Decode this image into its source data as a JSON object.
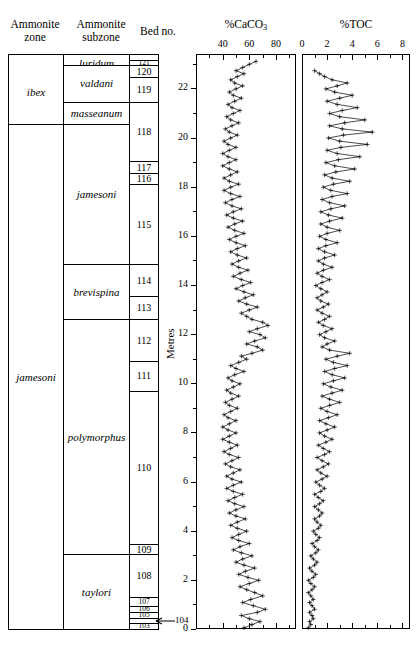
{
  "headers": {
    "zone": "Ammonite\nzone",
    "zone_l1": "Ammonite",
    "zone_l2": "zone",
    "subzone_l1": "Ammonite",
    "subzone_l2": "subzone",
    "bed": "Bed no."
  },
  "zones": [
    {
      "label": "ibex",
      "top_m": 23.15,
      "bottom_m": 20.55
    },
    {
      "label": "jamesoni",
      "top_m": 20.55,
      "bottom_m": 0.0
    }
  ],
  "subzones": [
    {
      "label": "luridum",
      "top_m": 23.15,
      "bottom_m": 22.95
    },
    {
      "label": "valdani",
      "top_m": 22.95,
      "bottom_m": 21.45
    },
    {
      "label": "masseanum",
      "top_m": 21.45,
      "bottom_m": 20.55
    },
    {
      "label": "jamesoni",
      "top_m": 20.55,
      "bottom_m": 14.85
    },
    {
      "label": "brevispina",
      "top_m": 14.85,
      "bottom_m": 12.6
    },
    {
      "label": "polymorphus",
      "top_m": 12.6,
      "bottom_m": 3.05
    },
    {
      "label": "taylori",
      "top_m": 3.05,
      "bottom_m": 0.0
    }
  ],
  "beds": [
    {
      "no": "121",
      "top_m": 23.15,
      "bottom_m": 22.95,
      "tiny": true
    },
    {
      "no": "120",
      "top_m": 22.95,
      "bottom_m": 22.45,
      "tiny": false
    },
    {
      "no": "119",
      "top_m": 22.45,
      "bottom_m": 21.45,
      "tiny": false
    },
    {
      "no": "118",
      "top_m": 21.45,
      "bottom_m": 19.05,
      "tiny": false
    },
    {
      "no": "117",
      "top_m": 19.05,
      "bottom_m": 18.55,
      "tiny": false
    },
    {
      "no": "116",
      "top_m": 18.55,
      "bottom_m": 18.1,
      "tiny": false
    },
    {
      "no": "115",
      "top_m": 18.1,
      "bottom_m": 14.85,
      "tiny": false
    },
    {
      "no": "114",
      "top_m": 14.85,
      "bottom_m": 13.55,
      "tiny": false
    },
    {
      "no": "113",
      "top_m": 13.55,
      "bottom_m": 12.6,
      "tiny": false
    },
    {
      "no": "112",
      "top_m": 12.6,
      "bottom_m": 10.9,
      "tiny": false
    },
    {
      "no": "111",
      "top_m": 10.9,
      "bottom_m": 9.7,
      "tiny": false
    },
    {
      "no": "110",
      "top_m": 9.7,
      "bottom_m": 3.45,
      "tiny": false
    },
    {
      "no": "109",
      "top_m": 3.45,
      "bottom_m": 3.05,
      "tiny": false
    },
    {
      "no": "108",
      "top_m": 3.05,
      "bottom_m": 1.3,
      "tiny": false
    },
    {
      "no": "107",
      "top_m": 1.3,
      "bottom_m": 0.95,
      "tiny": true
    },
    {
      "no": "106",
      "top_m": 0.95,
      "bottom_m": 0.7,
      "tiny": true
    },
    {
      "no": "105",
      "top_m": 0.7,
      "bottom_m": 0.45,
      "tiny": true
    },
    {
      "no": "103",
      "top_m": 0.25,
      "bottom_m": 0.0,
      "tiny": true
    }
  ],
  "bed104_callout": {
    "label": "104",
    "metres": 0.33
  },
  "metres_axis": {
    "label": "Metres",
    "min": 0,
    "max": 23.4,
    "ticks": [
      0,
      2,
      4,
      6,
      8,
      10,
      12,
      14,
      16,
      18,
      20,
      22
    ],
    "minor_step": 1
  },
  "chart_data": [
    {
      "type": "line",
      "title": "%CaCO3",
      "title_main": "%CaCO",
      "title_sub": "3",
      "xlabel": "%CaCO3",
      "ylabel": "Metres",
      "orientation": "vertical-depth",
      "xlim": [
        20,
        95
      ],
      "ticks": [
        40,
        60,
        80
      ],
      "minor_step": 10,
      "grid": false,
      "marker": "plus",
      "y": [
        0.05,
        0.18,
        0.3,
        0.42,
        0.55,
        0.68,
        0.8,
        0.95,
        1.08,
        1.2,
        1.35,
        1.48,
        1.6,
        1.72,
        1.85,
        1.98,
        2.1,
        2.22,
        2.35,
        2.48,
        2.6,
        2.72,
        2.85,
        2.98,
        3.1,
        3.22,
        3.35,
        3.48,
        3.6,
        3.72,
        3.85,
        3.98,
        4.1,
        4.22,
        4.35,
        4.48,
        4.6,
        4.72,
        4.85,
        4.98,
        5.1,
        5.22,
        5.35,
        5.48,
        5.6,
        5.72,
        5.85,
        5.98,
        6.1,
        6.22,
        6.35,
        6.48,
        6.6,
        6.72,
        6.85,
        6.98,
        7.1,
        7.22,
        7.35,
        7.48,
        7.6,
        7.72,
        7.85,
        7.98,
        8.1,
        8.22,
        8.35,
        8.48,
        8.6,
        8.72,
        8.85,
        8.98,
        9.1,
        9.22,
        9.35,
        9.48,
        9.6,
        9.72,
        9.85,
        9.98,
        10.1,
        10.22,
        10.35,
        10.48,
        10.6,
        10.72,
        10.85,
        10.98,
        11.1,
        11.22,
        11.35,
        11.48,
        11.6,
        11.72,
        11.85,
        11.98,
        12.1,
        12.22,
        12.35,
        12.48,
        12.6,
        12.72,
        12.85,
        12.98,
        13.1,
        13.22,
        13.35,
        13.48,
        13.6,
        13.72,
        13.85,
        13.98,
        14.1,
        14.22,
        14.35,
        14.48,
        14.6,
        14.72,
        14.85,
        14.98,
        15.1,
        15.22,
        15.35,
        15.48,
        15.6,
        15.72,
        15.85,
        15.98,
        16.1,
        16.22,
        16.35,
        16.48,
        16.6,
        16.72,
        16.85,
        16.98,
        17.1,
        17.22,
        17.35,
        17.48,
        17.6,
        17.72,
        17.85,
        17.98,
        18.1,
        18.22,
        18.35,
        18.48,
        18.6,
        18.72,
        18.85,
        18.98,
        19.1,
        19.22,
        19.35,
        19.48,
        19.6,
        19.72,
        19.85,
        19.98,
        20.1,
        20.22,
        20.35,
        20.48,
        20.6,
        20.72,
        20.85,
        20.98,
        21.1,
        21.22,
        21.35,
        21.48,
        21.6,
        21.72,
        21.85,
        21.98,
        22.1,
        22.22,
        22.35,
        22.48,
        22.6,
        22.72,
        22.85,
        22.98,
        23.1
      ],
      "values": [
        56,
        62,
        68,
        60,
        54,
        66,
        72,
        63,
        55,
        61,
        70,
        64,
        58,
        53,
        60,
        67,
        59,
        52,
        57,
        64,
        56,
        50,
        55,
        62,
        54,
        48,
        53,
        60,
        52,
        47,
        52,
        58,
        51,
        46,
        51,
        57,
        50,
        45,
        50,
        56,
        49,
        44,
        49,
        55,
        48,
        43,
        48,
        54,
        47,
        43,
        48,
        53,
        46,
        42,
        47,
        52,
        45,
        41,
        46,
        51,
        45,
        40,
        45,
        50,
        44,
        40,
        45,
        50,
        44,
        41,
        46,
        51,
        45,
        42,
        47,
        52,
        46,
        43,
        48,
        53,
        47,
        44,
        49,
        56,
        50,
        46,
        52,
        58,
        54,
        62,
        70,
        66,
        58,
        64,
        72,
        68,
        60,
        66,
        74,
        70,
        62,
        58,
        54,
        60,
        66,
        58,
        52,
        57,
        63,
        56,
        50,
        55,
        61,
        54,
        48,
        53,
        59,
        52,
        47,
        52,
        58,
        51,
        46,
        51,
        57,
        50,
        45,
        50,
        56,
        49,
        44,
        49,
        55,
        48,
        43,
        48,
        54,
        47,
        42,
        47,
        53,
        46,
        41,
        46,
        52,
        45,
        41,
        46,
        51,
        45,
        40,
        45,
        50,
        44,
        40,
        45,
        50,
        44,
        41,
        46,
        51,
        45,
        42,
        47,
        52,
        46,
        43,
        48,
        53,
        47,
        44,
        49,
        54,
        48,
        45,
        50,
        55,
        49,
        46,
        51,
        56,
        50,
        55,
        60,
        65
      ]
    },
    {
      "type": "line",
      "title": "%TOC",
      "title_main": "%TOC",
      "title_sub": "",
      "xlabel": "%TOC",
      "ylabel": "Metres",
      "orientation": "vertical-depth",
      "xlim": [
        0,
        8.6
      ],
      "ticks": [
        0,
        2,
        4,
        6,
        8
      ],
      "minor_step": 1,
      "grid": false,
      "marker": "plus",
      "y": [
        0.05,
        0.18,
        0.3,
        0.42,
        0.55,
        0.68,
        0.8,
        0.95,
        1.08,
        1.2,
        1.35,
        1.48,
        1.6,
        1.72,
        1.85,
        1.98,
        2.1,
        2.22,
        2.35,
        2.48,
        2.6,
        2.72,
        2.85,
        2.98,
        3.1,
        3.22,
        3.35,
        3.48,
        3.6,
        3.72,
        3.85,
        3.98,
        4.1,
        4.22,
        4.35,
        4.48,
        4.6,
        4.72,
        4.85,
        4.98,
        5.1,
        5.22,
        5.35,
        5.48,
        5.6,
        5.72,
        5.85,
        5.98,
        6.1,
        6.22,
        6.35,
        6.48,
        6.6,
        6.72,
        6.85,
        6.98,
        7.1,
        7.22,
        7.35,
        7.48,
        7.6,
        7.72,
        7.85,
        7.98,
        8.1,
        8.22,
        8.35,
        8.48,
        8.6,
        8.72,
        8.85,
        8.98,
        9.1,
        9.22,
        9.35,
        9.48,
        9.6,
        9.72,
        9.85,
        9.98,
        10.1,
        10.22,
        10.35,
        10.48,
        10.6,
        10.72,
        10.85,
        10.98,
        11.1,
        11.22,
        11.35,
        11.48,
        11.6,
        11.72,
        11.85,
        11.98,
        12.1,
        12.22,
        12.35,
        12.48,
        12.6,
        12.72,
        12.85,
        12.98,
        13.1,
        13.22,
        13.35,
        13.48,
        13.6,
        13.72,
        13.85,
        13.98,
        14.1,
        14.22,
        14.35,
        14.48,
        14.6,
        14.72,
        14.85,
        14.98,
        15.1,
        15.22,
        15.35,
        15.48,
        15.6,
        15.72,
        15.85,
        15.98,
        16.1,
        16.22,
        16.35,
        16.48,
        16.6,
        16.72,
        16.85,
        16.98,
        17.1,
        17.22,
        17.35,
        17.48,
        17.6,
        17.72,
        17.85,
        17.98,
        18.1,
        18.22,
        18.35,
        18.48,
        18.6,
        18.72,
        18.85,
        18.98,
        19.1,
        19.22,
        19.35,
        19.48,
        19.6,
        19.72,
        19.85,
        19.98,
        20.1,
        20.22,
        20.35,
        20.48,
        20.6,
        20.72,
        20.85,
        20.98,
        21.1,
        21.22,
        21.35,
        21.48,
        21.6,
        21.72,
        21.85,
        21.98,
        22.1,
        22.22,
        22.35,
        22.48,
        22.6,
        22.72,
        22.85,
        22.98,
        23.1
      ],
      "values": [
        0.5,
        0.7,
        0.6,
        0.9,
        0.8,
        0.6,
        1.0,
        0.8,
        0.6,
        0.9,
        0.7,
        0.5,
        0.8,
        1.0,
        0.7,
        0.5,
        0.9,
        1.1,
        0.8,
        0.6,
        1.0,
        1.2,
        0.9,
        0.7,
        1.1,
        1.3,
        1.0,
        0.8,
        1.2,
        1.4,
        1.1,
        0.9,
        1.3,
        1.5,
        1.2,
        1.0,
        1.4,
        1.6,
        1.3,
        1.0,
        1.4,
        1.7,
        1.3,
        1.0,
        1.5,
        1.8,
        1.4,
        1.1,
        1.6,
        2.0,
        1.5,
        1.2,
        1.7,
        2.1,
        1.6,
        1.2,
        1.8,
        2.2,
        1.7,
        1.3,
        1.9,
        2.4,
        1.8,
        1.4,
        2.0,
        2.6,
        1.9,
        1.4,
        2.1,
        2.8,
        2.0,
        1.5,
        2.2,
        3.0,
        2.2,
        1.6,
        2.4,
        3.2,
        2.3,
        1.7,
        2.5,
        3.4,
        2.4,
        1.8,
        2.6,
        3.6,
        2.5,
        1.9,
        2.8,
        3.8,
        2.2,
        1.6,
        2.0,
        2.6,
        1.8,
        1.4,
        1.9,
        2.4,
        1.7,
        1.3,
        1.8,
        2.2,
        1.6,
        1.2,
        1.7,
        2.1,
        1.5,
        1.2,
        1.6,
        2.0,
        1.5,
        1.1,
        1.6,
        2.2,
        1.6,
        1.2,
        1.7,
        2.4,
        1.7,
        1.3,
        1.8,
        2.6,
        1.8,
        1.3,
        1.9,
        2.8,
        1.9,
        1.4,
        2.0,
        3.0,
        2.0,
        1.5,
        2.2,
        3.2,
        2.1,
        1.5,
        2.3,
        3.4,
        2.2,
        1.6,
        2.4,
        3.6,
        2.3,
        1.7,
        2.5,
        3.8,
        2.4,
        1.8,
        2.7,
        4.2,
        2.6,
        1.9,
        2.9,
        4.6,
        2.8,
        2.0,
        3.1,
        5.2,
        3.0,
        2.1,
        3.3,
        5.6,
        3.2,
        2.2,
        3.4,
        5.0,
        3.0,
        2.2,
        3.2,
        4.4,
        2.8,
        2.0,
        3.0,
        4.0,
        2.6,
        1.9,
        2.8,
        3.6,
        2.4,
        1.8,
        1.4,
        1.0
      ]
    }
  ]
}
